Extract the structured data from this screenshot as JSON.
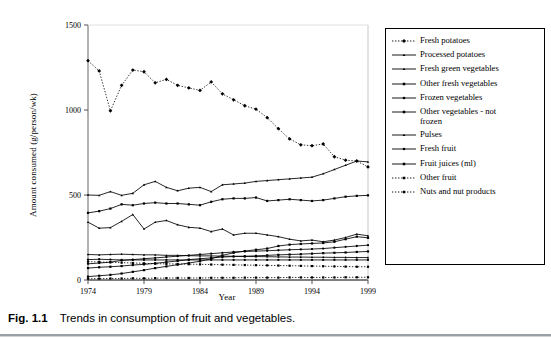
{
  "caption": {
    "number": "Fig. 1.1",
    "text": "Trends in consumption of fruit and vegetables."
  },
  "axes": {
    "x_title": "Year",
    "y_title": "Amount consumed (g/person/wk)",
    "x_ticks": [
      "1974",
      "1979",
      "1984",
      "1989",
      "1994",
      "1999"
    ],
    "y_ticks": [
      "0",
      "500",
      "1000",
      "1500"
    ]
  },
  "chart_data": {
    "type": "line",
    "title": "Trends in consumption of fruit and vegetables.",
    "xlabel": "Year",
    "ylabel": "Amount consumed (g/person/wk)",
    "xlim": [
      1974,
      1999
    ],
    "ylim": [
      0,
      1500
    ],
    "x_ticks": [
      1974,
      1979,
      1984,
      1989,
      1994,
      1999
    ],
    "y_ticks": [
      0,
      500,
      1000,
      1500
    ],
    "grid": false,
    "legend_position": "right",
    "x": [
      1974,
      1975,
      1976,
      1977,
      1978,
      1979,
      1980,
      1981,
      1982,
      1983,
      1984,
      1985,
      1986,
      1987,
      1988,
      1989,
      1990,
      1991,
      1992,
      1993,
      1994,
      1995,
      1996,
      1997,
      1998,
      1999
    ],
    "series": [
      {
        "name": "Fresh potatoes",
        "marker": "diamond",
        "line": "dotted",
        "values": [
          1290,
          1230,
          995,
          1145,
          1235,
          1225,
          1160,
          1180,
          1145,
          1130,
          1115,
          1165,
          1095,
          1060,
          1025,
          1005,
          955,
          890,
          830,
          795,
          790,
          800,
          725,
          705,
          700,
          665
        ]
      },
      {
        "name": "Processed potatoes",
        "marker": "triangle",
        "line": "solid",
        "values": [
          500,
          498,
          520,
          498,
          510,
          560,
          580,
          545,
          525,
          540,
          545,
          520,
          560,
          565,
          570,
          580,
          585,
          590,
          595,
          600,
          605,
          625,
          650,
          675,
          700,
          695
        ]
      },
      {
        "name": "Fresh green vegetables",
        "marker": "triangle",
        "line": "solid",
        "values": [
          340,
          305,
          308,
          345,
          385,
          300,
          340,
          350,
          325,
          310,
          305,
          285,
          300,
          265,
          275,
          275,
          265,
          255,
          240,
          230,
          235,
          225,
          235,
          250,
          270,
          260
        ]
      },
      {
        "name": "Other fresh vegetables",
        "marker": "square",
        "line": "solid",
        "values": [
          395,
          405,
          420,
          445,
          440,
          450,
          455,
          450,
          450,
          445,
          440,
          460,
          475,
          480,
          480,
          485,
          465,
          470,
          475,
          470,
          465,
          470,
          480,
          490,
          495,
          498
        ]
      },
      {
        "name": "Frozen vegetables",
        "marker": "circle",
        "line": "solid",
        "values": [
          95,
          100,
          105,
          115,
          120,
          125,
          130,
          135,
          140,
          145,
          150,
          155,
          160,
          165,
          168,
          170,
          172,
          175,
          178,
          180,
          182,
          185,
          190,
          195,
          200,
          205
        ]
      },
      {
        "name": "Other vegetables - not frozen",
        "marker": "square",
        "line": "solid",
        "values": [
          70,
          75,
          78,
          82,
          88,
          92,
          98,
          105,
          112,
          120,
          125,
          130,
          135,
          138,
          140,
          142,
          145,
          148,
          150,
          152,
          155,
          158,
          160,
          162,
          165,
          168
        ]
      },
      {
        "name": "Pulses",
        "marker": "triangle",
        "line": "solid",
        "values": [
          150,
          148,
          150,
          152,
          150,
          148,
          148,
          145,
          145,
          143,
          142,
          142,
          140,
          140,
          138,
          138,
          137,
          136,
          135,
          135,
          134,
          134,
          133,
          133,
          132,
          132
        ]
      },
      {
        "name": "Fresh fruit",
        "marker": "circle",
        "line": "solid",
        "values": [
          120,
          122,
          120,
          118,
          118,
          118,
          118,
          118,
          118,
          118,
          118,
          118,
          118,
          118,
          118,
          118,
          118,
          118,
          118,
          118,
          118,
          118,
          118,
          118,
          118,
          118
        ]
      },
      {
        "name": "Fruit juices (ml)",
        "marker": "square",
        "line": "solid",
        "values": [
          20,
          25,
          30,
          38,
          48,
          58,
          70,
          80,
          90,
          100,
          110,
          125,
          145,
          160,
          170,
          178,
          185,
          200,
          208,
          212,
          215,
          218,
          225,
          240,
          255,
          248
        ]
      },
      {
        "name": "Other fruit",
        "marker": "square",
        "line": "dotted",
        "values": [
          108,
          106,
          104,
          102,
          100,
          98,
          96,
          95,
          94,
          93,
          92,
          91,
          90,
          89,
          88,
          87,
          86,
          85,
          84,
          83,
          82,
          81,
          80,
          79,
          78,
          78
        ]
      },
      {
        "name": "Nuts and nut products",
        "marker": "square",
        "line": "dotted",
        "values": [
          8,
          8,
          9,
          9,
          10,
          10,
          11,
          11,
          12,
          12,
          12,
          13,
          13,
          13,
          14,
          14,
          14,
          14,
          15,
          15,
          15,
          15,
          15,
          16,
          16,
          16
        ]
      }
    ]
  },
  "legend": {
    "items": [
      {
        "label": "Fresh potatoes"
      },
      {
        "label": "Processed potatoes"
      },
      {
        "label": "Fresh green vegetables"
      },
      {
        "label": "Other fresh vegetables"
      },
      {
        "label": "Frozen vegetables"
      },
      {
        "label": "Other vegetables - not\nfrozen"
      },
      {
        "label": "Pulses"
      },
      {
        "label": "Fresh fruit"
      },
      {
        "label": "Fruit juices (ml)"
      },
      {
        "label": "Other fruit"
      },
      {
        "label": "Nuts and nut products"
      }
    ]
  },
  "colors": {
    "ink": "#000000",
    "background": "#ffffff",
    "rule": "#9aa0a6"
  }
}
